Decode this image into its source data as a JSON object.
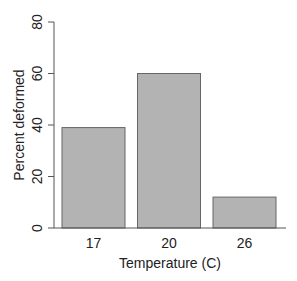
{
  "chart_data": {
    "type": "bar",
    "title": "",
    "xlabel": "Temperature (C)",
    "ylabel": "Percent deformed",
    "categories": [
      "17",
      "20",
      "26"
    ],
    "values": [
      39,
      60,
      12
    ],
    "ylim": [
      0,
      80
    ],
    "yticks": [
      "0",
      "20",
      "40",
      "60",
      "80"
    ],
    "grid": false,
    "legend": null,
    "bar_color": "#b3b3b3",
    "bar_border": "#666666"
  }
}
